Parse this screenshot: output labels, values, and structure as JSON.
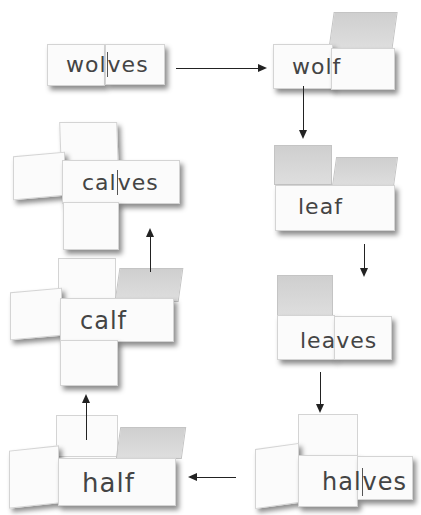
{
  "diagram": {
    "cards": [
      {
        "id": "wolves",
        "label": "wolves",
        "stem": "wol",
        "ending": "ves"
      },
      {
        "id": "wolf",
        "label": "wolf",
        "stem": "wol",
        "ending": "f"
      },
      {
        "id": "leaf",
        "label": "leaf",
        "stem": "lea",
        "ending": "f"
      },
      {
        "id": "leaves",
        "label": "leaves",
        "stem": "lea",
        "ending": "ves"
      },
      {
        "id": "halves",
        "label": "halves",
        "stem": "hal",
        "ending": "ves"
      },
      {
        "id": "half",
        "label": "half",
        "stem": "hal",
        "ending": "f"
      },
      {
        "id": "calf",
        "label": "calf",
        "stem": "cal",
        "ending": "f"
      },
      {
        "id": "calves",
        "label": "calves",
        "stem": "cal",
        "ending": "ves"
      }
    ],
    "sequence": [
      "wolves",
      "wolf",
      "leaf",
      "leaves",
      "halves",
      "half",
      "calf",
      "calves"
    ],
    "colors": {
      "paper": "#fbfbfb",
      "flap": "#d6d6d6",
      "ink": "#444444",
      "arrow": "#222222"
    }
  }
}
